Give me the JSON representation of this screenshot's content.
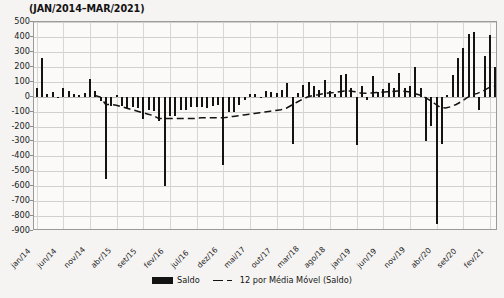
{
  "chart_data": {
    "type": "bar",
    "title": "(JAN/2014–MAR/2021)",
    "xlabel": "",
    "ylabel": "",
    "ylim": [
      -900,
      500
    ],
    "ytick_step": 100,
    "grid": true,
    "legend_position": "bottom",
    "yticks": [
      "500",
      "400",
      "300",
      "200",
      "100",
      "0",
      "-100",
      "-200",
      "-300",
      "-400",
      "-500",
      "-600",
      "-700",
      "-800",
      "-900"
    ],
    "xtick_labels": [
      "jan/14",
      "jun/14",
      "nov/14",
      "abr/15",
      "set/15",
      "fev/16",
      "jul/16",
      "dez/16",
      "mai/17",
      "out/17",
      "mar/18",
      "ago/18",
      "jan/19",
      "jun/19",
      "nov/19",
      "abr/20",
      "set/20",
      "fev/21"
    ],
    "xtick_indices": [
      0,
      5,
      10,
      15,
      20,
      25,
      30,
      35,
      40,
      45,
      50,
      55,
      60,
      65,
      70,
      75,
      80,
      85
    ],
    "categories": [
      "jan/14",
      "fev/14",
      "mar/14",
      "abr/14",
      "mai/14",
      "jun/14",
      "jul/14",
      "ago/14",
      "set/14",
      "out/14",
      "nov/14",
      "dez/14",
      "jan/15",
      "fev/15",
      "mar/15",
      "abr/15",
      "mai/15",
      "jun/15",
      "jul/15",
      "ago/15",
      "set/15",
      "out/15",
      "nov/15",
      "dez/15",
      "jan/16",
      "fev/16",
      "mar/16",
      "abr/16",
      "mai/16",
      "jun/16",
      "jul/16",
      "ago/16",
      "set/16",
      "out/16",
      "nov/16",
      "dez/16",
      "jan/17",
      "fev/17",
      "mar/17",
      "abr/17",
      "mai/17",
      "jun/17",
      "jul/17",
      "ago/17",
      "set/17",
      "out/17",
      "nov/17",
      "dez/17",
      "jan/18",
      "fev/18",
      "mar/18",
      "abr/18",
      "mai/18",
      "jun/18",
      "jul/18",
      "ago/18",
      "set/18",
      "out/18",
      "nov/18",
      "dez/18",
      "jan/19",
      "fev/19",
      "mar/19",
      "abr/19",
      "mai/19",
      "jun/19",
      "jul/19",
      "ago/19",
      "set/19",
      "out/19",
      "nov/19",
      "dez/19",
      "jan/20",
      "fev/20",
      "mar/20",
      "abr/20",
      "mai/20",
      "jun/20",
      "jul/20",
      "ago/20",
      "set/20",
      "out/20",
      "nov/20",
      "dez/20",
      "jan/21",
      "fev/21",
      "mar/21"
    ],
    "series": [
      {
        "name": "Saldo",
        "type": "bar",
        "color": "#131313",
        "values": [
          60,
          260,
          20,
          30,
          -10,
          55,
          40,
          15,
          10,
          25,
          120,
          35,
          -30,
          -550,
          -60,
          10,
          -65,
          -75,
          -70,
          -75,
          -150,
          -90,
          -95,
          -165,
          -600,
          -130,
          -130,
          -90,
          -90,
          -70,
          -70,
          -70,
          -75,
          -60,
          -55,
          -455,
          -100,
          -105,
          -55,
          -25,
          15,
          20,
          -5,
          40,
          30,
          25,
          45,
          90,
          -320,
          25,
          80,
          95,
          70,
          45,
          110,
          35,
          20,
          145,
          150,
          60,
          -325,
          70,
          -25,
          140,
          30,
          50,
          90,
          60,
          160,
          55,
          70,
          200,
          60,
          -295,
          -200,
          -850,
          -315,
          10,
          145,
          260,
          325,
          420,
          430,
          -90,
          270,
          410,
          200
        ]
      },
      {
        "name": "12 por Média Móvel (Saldo)",
        "type": "line",
        "style": "dashed",
        "color": "#131313",
        "values": [
          null,
          null,
          null,
          null,
          null,
          null,
          null,
          null,
          null,
          null,
          null,
          5,
          -5,
          -55,
          -55,
          -60,
          -70,
          -80,
          -90,
          -100,
          -110,
          -120,
          -130,
          -150,
          -150,
          -150,
          -150,
          -150,
          -150,
          -150,
          -148,
          -145,
          -145,
          -145,
          -145,
          -145,
          -140,
          -135,
          -130,
          -125,
          -120,
          -115,
          -110,
          -105,
          -100,
          -95,
          -90,
          -80,
          -60,
          -40,
          -20,
          -5,
          5,
          10,
          18,
          22,
          25,
          30,
          35,
          35,
          30,
          22,
          20,
          22,
          25,
          28,
          30,
          32,
          35,
          35,
          30,
          20,
          10,
          -5,
          -25,
          -50,
          -75,
          -78,
          -70,
          -55,
          -35,
          -10,
          10,
          20,
          35,
          55,
          70
        ]
      }
    ]
  },
  "legend": {
    "items": [
      {
        "label": "Saldo",
        "marker": "bar-swatch"
      },
      {
        "label": "12 por Média Móvel (Saldo)",
        "marker": "dashed-line-swatch"
      }
    ]
  }
}
